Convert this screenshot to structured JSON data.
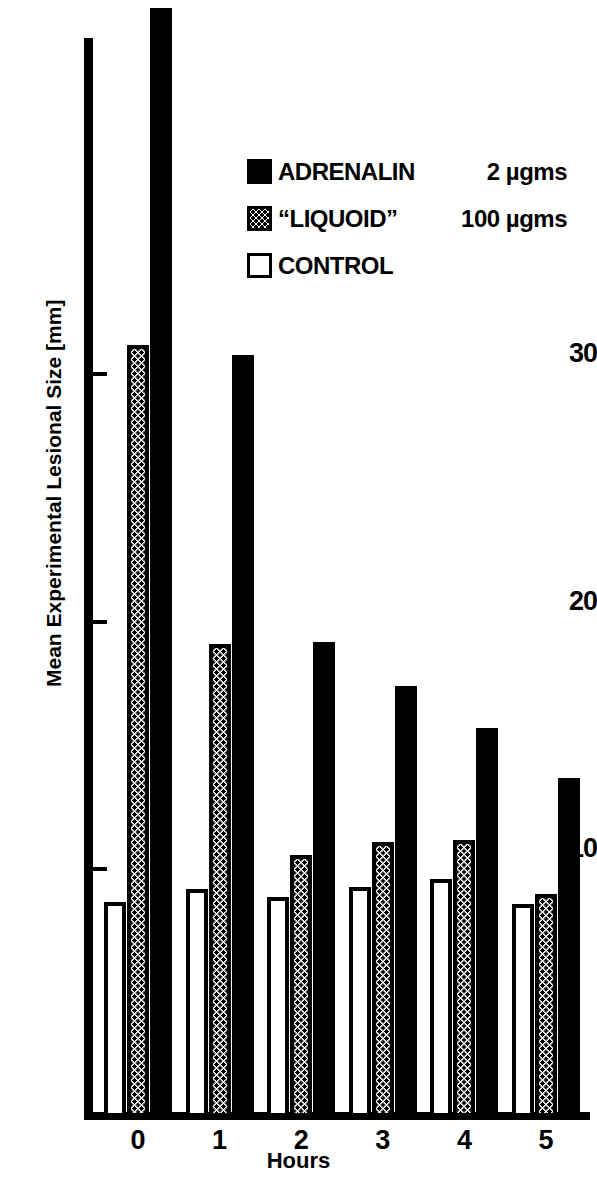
{
  "chart_data": {
    "type": "bar",
    "title": "",
    "xlabel": "Hours",
    "ylabel": "Mean Experimental Lesional Size [mm]",
    "categories": [
      "0",
      "1",
      "2",
      "3",
      "4",
      "5"
    ],
    "ylim": [
      0,
      44
    ],
    "yticks": [
      10,
      20,
      30
    ],
    "ytick_labels": [
      "10",
      "20",
      "30"
    ],
    "grid": false,
    "legend_position": "upper-center-right",
    "series": [
      {
        "name": "CONTROL",
        "dose": "",
        "style": "white-open",
        "color": "#ffffff",
        "values": [
          8.7,
          9.2,
          8.9,
          9.3,
          9.6,
          8.6
        ]
      },
      {
        "name": "“LIQUOID”",
        "dose": "100 µgms",
        "style": "stippled",
        "color": "#bbbbbb",
        "values": [
          31.2,
          19.1,
          10.6,
          11.1,
          11.2,
          9.0
        ]
      },
      {
        "name": "ADRENALIN",
        "dose": "2 µgms",
        "style": "solid-black",
        "color": "#000000",
        "values": [
          45.0,
          30.8,
          19.2,
          17.4,
          15.7,
          13.7
        ],
        "notes": "Hour 0 bar extends beyond the top of the plotting area"
      }
    ]
  },
  "legend": {
    "rows": [
      {
        "name": "ADRENALIN",
        "dose": "2 µgms",
        "swatch": "solid-black-swatch"
      },
      {
        "name": "“LIQUOID”",
        "dose": "100 µgms",
        "swatch": "stippled-swatch"
      },
      {
        "name": "CONTROL",
        "dose": "",
        "swatch": "white-open-swatch"
      }
    ]
  },
  "axes": {
    "y_label": "Mean Experimental Lesional Size [mm]",
    "x_label": "Hours",
    "y_ticks": [
      "30",
      "20",
      "10"
    ],
    "x_ticks": [
      "0",
      "1",
      "2",
      "3",
      "4",
      "5"
    ]
  }
}
